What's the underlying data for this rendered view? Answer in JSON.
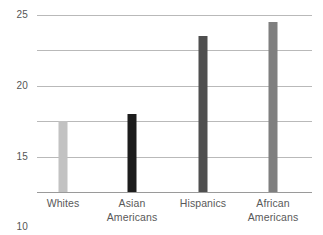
{
  "chart_data": {
    "type": "bar",
    "title": "",
    "subtitle": "",
    "xlabel": "",
    "ylabel": "",
    "categories": [
      "Whites",
      "Asian Americans",
      "Hispanics",
      "African Americans"
    ],
    "category_lines": [
      [
        "Whites"
      ],
      [
        "Asian",
        "Americans"
      ],
      [
        "Hispanics"
      ],
      [
        "African",
        "Americans"
      ]
    ],
    "values": [
      10,
      11,
      22,
      24
    ],
    "bar_colors": [
      "#c2c2c2",
      "#1c1c1c",
      "#4f4f4f",
      "#7f7f7f"
    ],
    "ylim": [
      0,
      25
    ],
    "yticks": [
      0,
      5,
      10,
      15,
      20,
      25
    ],
    "ytick_labels": [
      "0",
      "5",
      "10",
      "15",
      "20",
      "25"
    ],
    "grid": true,
    "grid_color": "#b9b9b9",
    "axis_color": "#9a9a9a",
    "legend": null,
    "legend_position": "none",
    "annotations": []
  }
}
